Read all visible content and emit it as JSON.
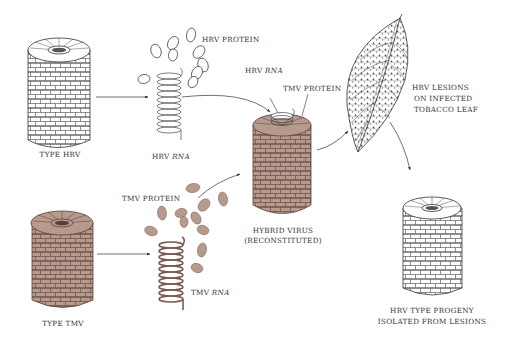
{
  "colors": {
    "tmv_fill": "#b79a8e",
    "tmv_stroke": "#5a4038",
    "hrv_fill": "#ffffff",
    "hrv_stroke": "#333333",
    "arrow": "#333333"
  },
  "labels": {
    "type_hrv": "TYPE HRV",
    "hrv_protein": "HRV PROTEIN",
    "hrv_rna_prefix": "HRV ",
    "hrv_rna_suffix": "RNA",
    "hybrid_hrv_rna_prefix": "HRV ",
    "hybrid_hrv_rna_suffix": "RNA",
    "hybrid_tmv_protein": "TMV PROTEIN",
    "lesions_line1": "HRV LESIONS",
    "lesions_line2": "ON INFECTED",
    "lesions_line3": "TOBACCO LEAF",
    "type_tmv": "TYPE TMV",
    "tmv_protein": "TMV PROTEIN",
    "tmv_rna_prefix": "TMV ",
    "tmv_rna_suffix": "RNA",
    "hybrid_line1": "HYBRID VIRUS",
    "hybrid_line2": "(RECONSTITUTED)",
    "progeny_line1": "HRV TYPE PROGENY",
    "progeny_line2": "ISOLATED FROM LESIONS"
  },
  "components": [
    {
      "id": "type-hrv-virus",
      "kind": "virus-rod",
      "strain": "HRV"
    },
    {
      "id": "hrv-protein-subunits",
      "kind": "protein-subunits",
      "strain": "HRV"
    },
    {
      "id": "hrv-rna-coil",
      "kind": "rna-helix",
      "strain": "HRV"
    },
    {
      "id": "type-tmv-virus",
      "kind": "virus-rod",
      "strain": "TMV"
    },
    {
      "id": "tmv-protein-subunits",
      "kind": "protein-subunits",
      "strain": "TMV"
    },
    {
      "id": "tmv-rna-coil",
      "kind": "rna-helix",
      "strain": "TMV"
    },
    {
      "id": "hybrid-virus",
      "kind": "virus-rod",
      "strain": "HRV RNA + TMV protein"
    },
    {
      "id": "tobacco-leaf",
      "kind": "leaf",
      "strain": "HRV lesions"
    },
    {
      "id": "hrv-progeny-virus",
      "kind": "virus-rod",
      "strain": "HRV"
    }
  ],
  "flow": [
    {
      "from": "type-hrv-virus",
      "to": "hrv-rna-coil"
    },
    {
      "from": "hrv-rna-coil",
      "to": "hybrid-virus"
    },
    {
      "from": "type-tmv-virus",
      "to": "tmv-rna-coil"
    },
    {
      "from": "tmv-protein-subunits",
      "to": "hybrid-virus"
    },
    {
      "from": "hybrid-virus",
      "to": "tobacco-leaf"
    },
    {
      "from": "tobacco-leaf",
      "to": "hrv-progeny-virus"
    }
  ]
}
